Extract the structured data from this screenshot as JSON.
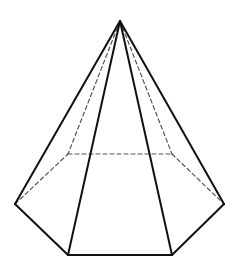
{
  "diagram": {
    "shape": "hexagonal-pyramid",
    "colors": {
      "background": "#ffffff",
      "visible_edge": "#111111",
      "hidden_edge": "#555555"
    },
    "stroke": {
      "visible_width": 2,
      "hidden_width": 1.2,
      "dash": "4 3"
    },
    "vertices": {
      "apex": [
        120,
        21
      ],
      "base_left": [
        15,
        204
      ],
      "base_front_left": [
        68,
        255
      ],
      "base_front_right": [
        172,
        255
      ],
      "base_right": [
        224,
        204
      ],
      "base_back_right": [
        172,
        154
      ],
      "base_back_left": [
        68,
        154
      ]
    },
    "visible_edges": [
      [
        "apex",
        "base_left"
      ],
      [
        "apex",
        "base_front_left"
      ],
      [
        "apex",
        "base_front_right"
      ],
      [
        "apex",
        "base_right"
      ],
      [
        "base_left",
        "base_front_left"
      ],
      [
        "base_front_left",
        "base_front_right"
      ],
      [
        "base_front_right",
        "base_right"
      ]
    ],
    "hidden_edges": [
      [
        "apex",
        "base_back_left"
      ],
      [
        "apex",
        "base_back_right"
      ],
      [
        "base_left",
        "base_back_left"
      ],
      [
        "base_back_left",
        "base_back_right"
      ],
      [
        "base_back_right",
        "base_right"
      ]
    ]
  }
}
